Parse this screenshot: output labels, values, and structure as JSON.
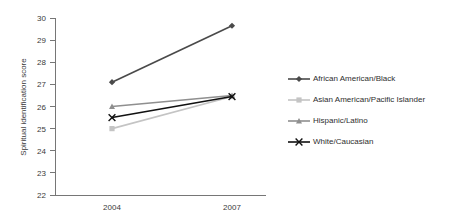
{
  "chart_data": {
    "type": "line",
    "title": "",
    "subtitle": "",
    "xlabel": "",
    "ylabel": "Spiritual identification score",
    "categories": [
      "2004",
      "2007"
    ],
    "x": [
      2004,
      2007
    ],
    "ylim": [
      22,
      30
    ],
    "yticks": [
      22,
      23,
      24,
      25,
      26,
      27,
      28,
      29,
      30
    ],
    "ytick_labels": [
      "22",
      "23",
      "24",
      "25",
      "26",
      "27",
      "28",
      "29",
      "30"
    ],
    "xtick_labels": [
      "2004",
      "2007"
    ],
    "grid": false,
    "legend_position": "right",
    "background_color": "#ffffff",
    "axis_color": "#767676",
    "series": [
      {
        "name": "African American/Black",
        "values": [
          27.1,
          29.65
        ],
        "color": "#4a4a4a",
        "marker": "diamond"
      },
      {
        "name": "Asian American/Pacific Islander",
        "values": [
          25.0,
          26.45
        ],
        "color": "#c4c4c4",
        "marker": "square"
      },
      {
        "name": "Hispanic/Latino",
        "values": [
          26.0,
          26.5
        ],
        "color": "#8f8f8f",
        "marker": "triangle"
      },
      {
        "name": "White/Caucasian",
        "values": [
          25.5,
          26.45
        ],
        "color": "#111111",
        "marker": "cross"
      }
    ]
  },
  "legend": {
    "items": [
      {
        "label": "African American/Black"
      },
      {
        "label": "Asian American/Pacific Islander"
      },
      {
        "label": "Hispanic/Latino"
      },
      {
        "label": "White/Caucasian"
      }
    ]
  }
}
